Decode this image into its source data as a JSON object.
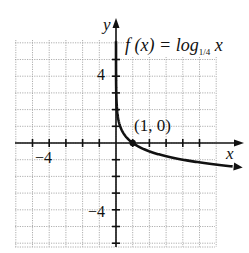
{
  "chart_data": {
    "type": "line",
    "function_label": {
      "prefix": "f (x) = log",
      "base": "1/4",
      "suffix": " x"
    },
    "xlabel": "x",
    "ylabel": "y",
    "xlim": [
      -6,
      6
    ],
    "ylim": [
      -6,
      6
    ],
    "grid": true,
    "x_tick_labels": [
      {
        "value": -4,
        "label": "−4"
      }
    ],
    "y_tick_labels": [
      {
        "value": 4,
        "label": "4"
      },
      {
        "value": -4,
        "label": "−4"
      }
    ],
    "annotations": [
      {
        "x": 1,
        "y": 0,
        "label": "(1, 0)"
      }
    ],
    "series": [
      {
        "name": "f(x) = log_{1/4} x",
        "x": [
          0.0625,
          0.125,
          0.25,
          0.5,
          1,
          2,
          4,
          8,
          10
        ],
        "y": [
          2,
          1.5,
          1,
          0.5,
          0,
          -0.5,
          -1,
          -1.5,
          -1.66
        ]
      }
    ]
  },
  "labels": {
    "y_axis": "y",
    "x_axis": "x",
    "func_prefix": "f (x) = log",
    "func_base": "1/4",
    "func_var": "x",
    "point": "(1, 0)",
    "xtick_neg4": "−4",
    "ytick_4": "4",
    "ytick_neg4": "−4"
  }
}
